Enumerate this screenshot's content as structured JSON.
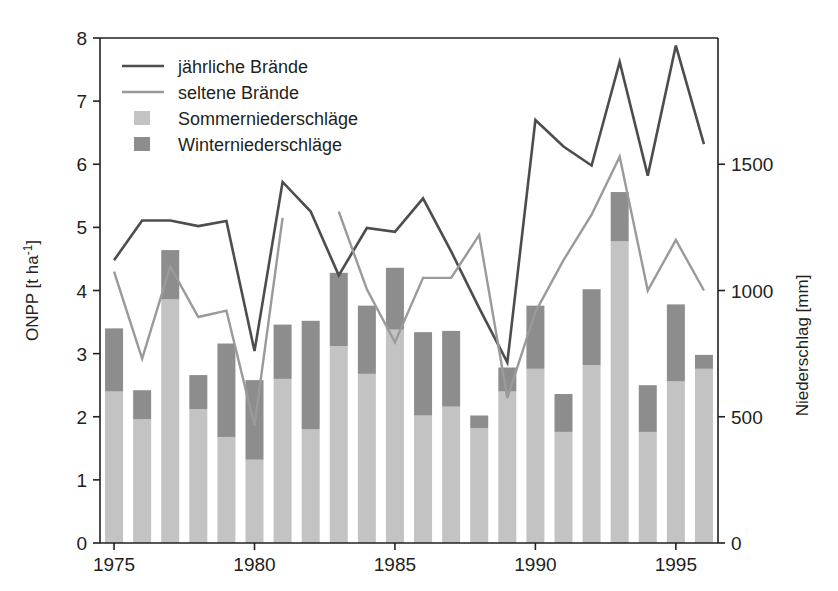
{
  "chart_data": {
    "type": "line",
    "title": "",
    "xlabel": "",
    "ylabel": "ONPP [t ha-1]",
    "ylabel_base": "ONPP [t ha",
    "ylabel_sup": "-1",
    "ylabel_tail": "]",
    "y2label": "Niederschlag [mm]",
    "xlim": [
      1974.5,
      1996.5
    ],
    "ylim": [
      0,
      8
    ],
    "y2lim": [
      0,
      2000
    ],
    "grid": false,
    "legend_position": "top-left",
    "x": [
      1975,
      1976,
      1977,
      1978,
      1979,
      1980,
      1981,
      1982,
      1983,
      1984,
      1985,
      1986,
      1987,
      1988,
      1989,
      1990,
      1991,
      1992,
      1993,
      1994,
      1995,
      1996
    ],
    "xticks": [
      1975,
      1980,
      1985,
      1990,
      1995
    ],
    "xticklabels": [
      "1975",
      "1980",
      "1985",
      "1990",
      "1995"
    ],
    "yticks": [
      0,
      1,
      2,
      3,
      4,
      5,
      6,
      7,
      8
    ],
    "yticklabels": [
      "0",
      "1",
      "2",
      "3",
      "4",
      "5",
      "6",
      "7",
      "8"
    ],
    "y2ticks": [
      0,
      500,
      1000,
      1500
    ],
    "y2ticklabels": [
      "0",
      "500",
      "1000",
      "1500"
    ],
    "series": [
      {
        "name": "jährliche Brände",
        "type": "line",
        "color": "#4d4d4d",
        "axis": "left",
        "values": [
          4.48,
          5.11,
          5.11,
          5.02,
          5.1,
          3.04,
          5.72,
          5.25,
          4.24,
          4.99,
          4.93,
          5.46,
          4.62,
          3.72,
          2.86,
          6.7,
          6.28,
          5.98,
          7.62,
          5.82,
          7.88,
          6.32
        ]
      },
      {
        "name": "seltene Brände",
        "type": "line",
        "color": "#9a9a9a",
        "axis": "left",
        "segments": [
          {
            "x": [
              1975,
              1976,
              1977,
              1978,
              1979,
              1980,
              1981
            ],
            "values": [
              4.3,
              2.92,
              4.38,
              3.58,
              3.68,
              1.86,
              5.15
            ]
          },
          {
            "x": [
              1983,
              1984,
              1985,
              1986,
              1987,
              1988,
              1989,
              1990,
              1991,
              1992,
              1993,
              1994,
              1995,
              1996
            ],
            "values": [
              5.25,
              4.02,
              3.18,
              4.2,
              4.2,
              4.88,
              2.3,
              3.66,
              4.48,
              5.2,
              6.12,
              4.0,
              4.8,
              4.0
            ]
          }
        ]
      },
      {
        "name": "Sommerniederschläge",
        "type": "bar",
        "color": "#c3c3c3",
        "axis": "right",
        "unit": "mm",
        "values": [
          600,
          490,
          965,
          530,
          420,
          330,
          650,
          450,
          780,
          670,
          845,
          505,
          540,
          455,
          600,
          690,
          440,
          705,
          1195,
          440,
          640,
          690
        ]
      },
      {
        "name": "Winterniederschläge",
        "type": "bar",
        "color": "#8d8d8d",
        "axis": "right",
        "unit": "mm",
        "values": [
          250,
          115,
          195,
          135,
          370,
          315,
          215,
          430,
          290,
          270,
          245,
          330,
          300,
          50,
          95,
          250,
          150,
          300,
          195,
          185,
          305,
          55
        ]
      }
    ],
    "legend": [
      {
        "label": "jährliche Brände",
        "marker": "line",
        "color": "#4d4d4d"
      },
      {
        "label": "seltene Brände",
        "marker": "line",
        "color": "#9a9a9a"
      },
      {
        "label": "Sommerniederschläge",
        "marker": "swatch",
        "color": "#c3c3c3"
      },
      {
        "label": "Winterniederschläge",
        "marker": "swatch",
        "color": "#8d8d8d"
      }
    ]
  }
}
